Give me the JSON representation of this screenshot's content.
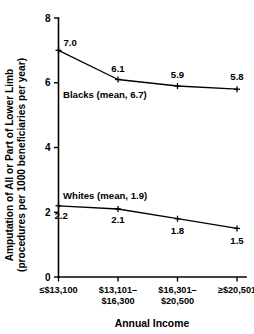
{
  "chart_data": {
    "type": "line",
    "title": "",
    "xlabel": "Annual Income",
    "ylabel_line1": "Amputation of All or Part of Lower Limb",
    "ylabel_line2": "(procedures per 1000 beneficiaries per year)",
    "categories": [
      {
        "line1": "≤$13,100",
        "line2": ""
      },
      {
        "line1": "$13,101–",
        "line2": "$16,300"
      },
      {
        "line1": "$16,301–",
        "line2": "$20,500"
      },
      {
        "line1": "≥$20,501",
        "line2": ""
      }
    ],
    "ylim": [
      0,
      8
    ],
    "yticks": [
      "0",
      "2",
      "4",
      "6",
      "8"
    ],
    "ytick_values": [
      0,
      2,
      4,
      6,
      8
    ],
    "grid": false,
    "legend_position": "inline-annotation",
    "series": [
      {
        "name": "Blacks",
        "annotation": "Blacks (mean, 6.7)",
        "mean": 6.7,
        "values": [
          7.0,
          6.1,
          5.9,
          5.8
        ],
        "data_labels": [
          "7.0",
          "6.1",
          "5.9",
          "5.8"
        ]
      },
      {
        "name": "Whites",
        "annotation": "Whites (mean, 1.9)",
        "mean": 1.9,
        "values": [
          2.2,
          2.1,
          1.8,
          1.5
        ],
        "data_labels": [
          "2.2",
          "2.1",
          "1.8",
          "1.5"
        ]
      }
    ]
  }
}
